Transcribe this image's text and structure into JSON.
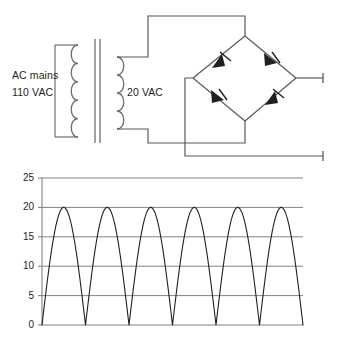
{
  "figure": {
    "colors": {
      "wire": "#58595b",
      "coil": "#6d6e71",
      "diode": "#231f20",
      "axis": "#808285",
      "grid": "#808285",
      "waveform": "#231f20",
      "text": "#231f20",
      "background": "#ffffff"
    }
  },
  "circuit": {
    "labels": {
      "primary_source": "AC mains",
      "primary_voltage": "110 VAC",
      "secondary_voltage": "20 VAC"
    },
    "components": {
      "transformer": {
        "name": "step-down-transformer",
        "primary_turns": 5,
        "secondary_turns": 4,
        "core": "laminated-double-bar"
      },
      "bridge": {
        "name": "diode-bridge-rectifier",
        "diode_count": 4,
        "diodes": [
          {
            "id": "diode-top-left",
            "position": "top-left",
            "direction": "up-right"
          },
          {
            "id": "diode-top-right",
            "position": "top-right",
            "direction": "down-right"
          },
          {
            "id": "diode-bottom-left",
            "position": "bottom-left",
            "direction": "down-right"
          },
          {
            "id": "diode-bottom-right",
            "position": "bottom-right",
            "direction": "up-right"
          }
        ]
      },
      "outputs": [
        {
          "id": "output-terminal-positive",
          "position": "upper-right"
        },
        {
          "id": "output-terminal-negative",
          "position": "lower-right"
        }
      ]
    }
  },
  "chart_data": {
    "type": "line",
    "title": "",
    "xlabel": "",
    "ylabel": "",
    "grid": true,
    "legend": false,
    "ylim": [
      0,
      25
    ],
    "xlim": [
      0,
      6
    ],
    "yticks": [
      0,
      5,
      10,
      15,
      20,
      25
    ],
    "ytick_labels": [
      "0",
      "5",
      "10",
      "15",
      "20",
      "25"
    ],
    "xtick_labels": [],
    "series": [
      {
        "name": "Rectified output voltage",
        "waveform": "full-wave-rectified-sine",
        "amplitude": 20,
        "baseline": 0,
        "cycles": 6,
        "peak_value": 20,
        "minimum_value": 0,
        "peaks": [
          {
            "x": 0.5,
            "y": 20
          },
          {
            "x": 1.5,
            "y": 20
          },
          {
            "x": 2.5,
            "y": 20
          },
          {
            "x": 3.5,
            "y": 20
          },
          {
            "x": 4.5,
            "y": 20
          },
          {
            "x": 5.5,
            "y": 20
          }
        ],
        "zeros": [
          {
            "x": 0,
            "y": 0
          },
          {
            "x": 1,
            "y": 0
          },
          {
            "x": 2,
            "y": 0
          },
          {
            "x": 3,
            "y": 0
          },
          {
            "x": 4,
            "y": 0
          },
          {
            "x": 5,
            "y": 0
          },
          {
            "x": 6,
            "y": 0
          }
        ]
      }
    ]
  }
}
